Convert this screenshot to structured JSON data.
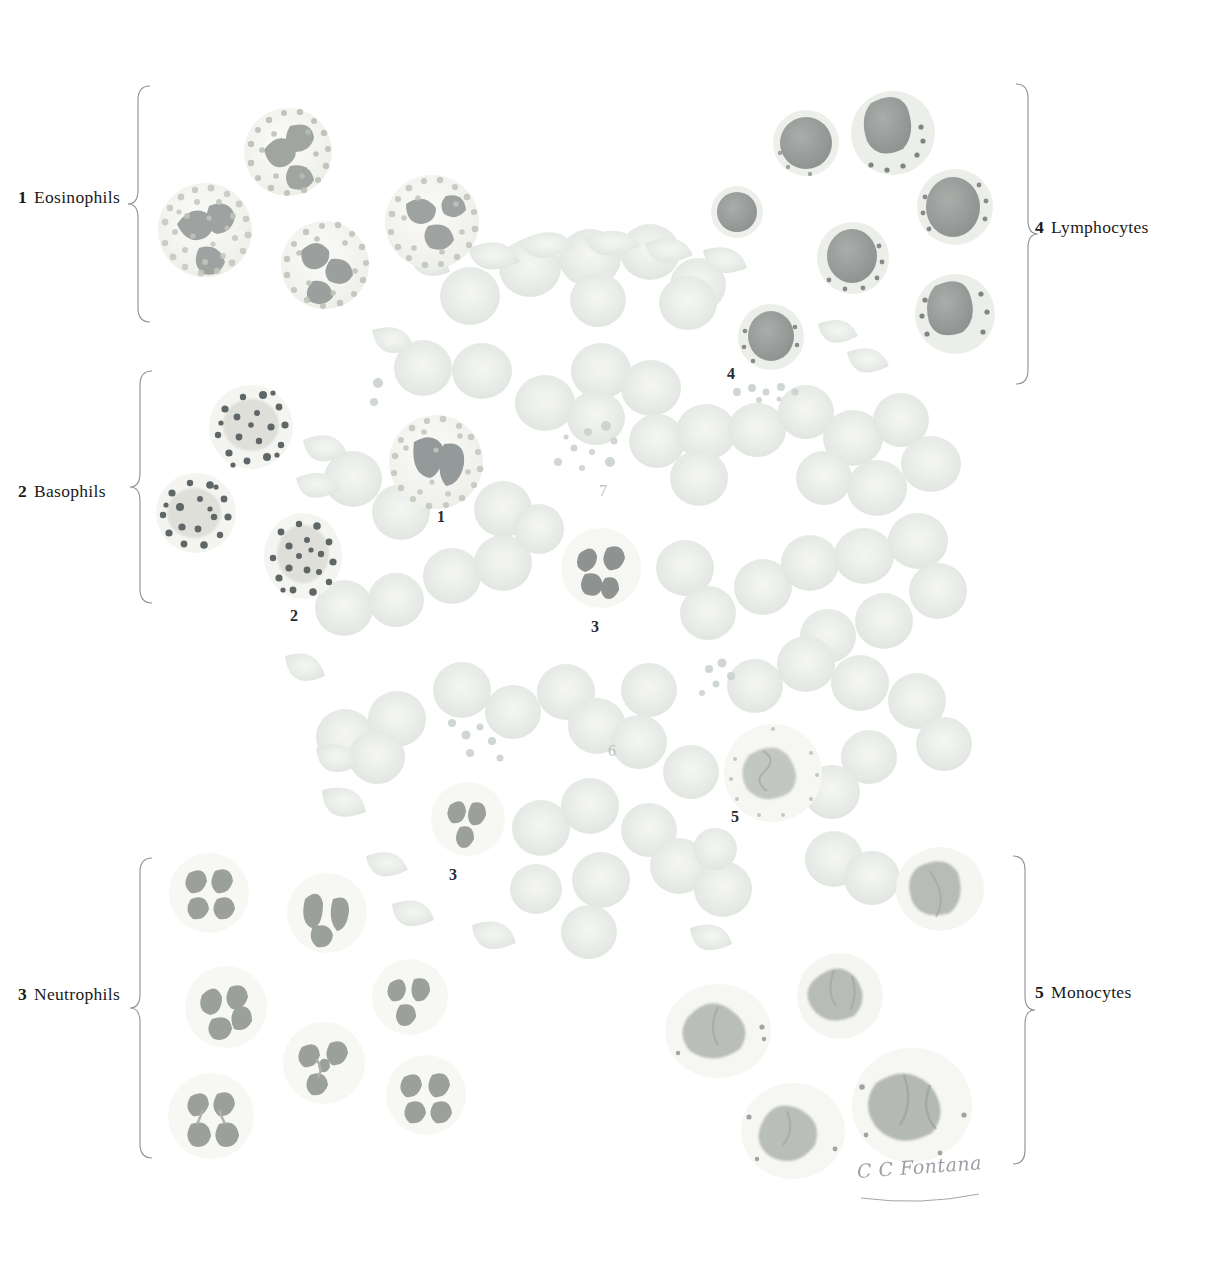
{
  "plate": {
    "title_visible": false,
    "background_color": "#ffffff",
    "ink_color": "#1a1a1a",
    "signature": "C C Fontana"
  },
  "legend": {
    "left_items": [
      {
        "num": "1",
        "label": "Eosinophils",
        "x": 18,
        "y": 187,
        "bracket": {
          "x": 138,
          "y": 86,
          "height": 235
        }
      },
      {
        "num": "2",
        "label": "Basophils",
        "x": 18,
        "y": 481,
        "bracket": {
          "x": 140,
          "y": 371,
          "height": 232
        }
      },
      {
        "num": "3",
        "label": "Neutrophils",
        "x": 18,
        "y": 984,
        "bracket": {
          "x": 140,
          "y": 858,
          "height": 300
        }
      }
    ],
    "right_items": [
      {
        "num": "4",
        "label": "Lymphocytes",
        "x": 1035,
        "y": 217,
        "bracket": {
          "x": 1016,
          "y": 84,
          "height": 300
        }
      },
      {
        "num": "5",
        "label": "Monocytes",
        "x": 1035,
        "y": 982,
        "bracket": {
          "x": 1013,
          "y": 856,
          "height": 310
        }
      }
    ]
  },
  "callouts": [
    {
      "id": "1",
      "text": "1",
      "x": 437,
      "y": 508,
      "faint": false
    },
    {
      "id": "2",
      "text": "2",
      "x": 290,
      "y": 607,
      "faint": false
    },
    {
      "id": "3a",
      "text": "3",
      "x": 591,
      "y": 618,
      "faint": false
    },
    {
      "id": "3b",
      "text": "3",
      "x": 449,
      "y": 866,
      "faint": false
    },
    {
      "id": "4",
      "text": "4",
      "x": 727,
      "y": 365,
      "faint": false
    },
    {
      "id": "5",
      "text": "5",
      "x": 731,
      "y": 808,
      "faint": false
    },
    {
      "id": "6",
      "text": "6",
      "x": 608,
      "y": 742,
      "faint": true
    },
    {
      "id": "7",
      "text": "7",
      "x": 599,
      "y": 482,
      "faint": true
    }
  ],
  "cell_groups": {
    "eosinophils": {
      "key": "1",
      "fill": "#f3f2ee",
      "granule": "#b9bdb4",
      "nucleus": "#9ca0a0",
      "cells": [
        {
          "cx": 205,
          "cy": 230,
          "r": 47,
          "nuclei": 3,
          "seed": 11
        },
        {
          "cx": 288,
          "cy": 152,
          "r": 44,
          "nuclei": 3,
          "seed": 12
        },
        {
          "cx": 325,
          "cy": 265,
          "r": 44,
          "nuclei": 3,
          "seed": 13
        },
        {
          "cx": 432,
          "cy": 222,
          "r": 47,
          "nuclei": 3,
          "seed": 14
        },
        {
          "cx": 436,
          "cy": 462,
          "r": 47,
          "nuclei": 2,
          "seed": 15
        }
      ]
    },
    "basophils": {
      "key": "2",
      "fill": "#f4f3f0",
      "granule": "#5d6466",
      "nucleus": "#c0c4c0",
      "cells": [
        {
          "cx": 251,
          "cy": 427,
          "r": 42,
          "seed": 21
        },
        {
          "cx": 196,
          "cy": 513,
          "r": 40,
          "seed": 22
        },
        {
          "cx": 303,
          "cy": 556,
          "r": 40,
          "seed": 23
        }
      ]
    },
    "neutrophils": {
      "key": "3",
      "fill": "#f6f5f2",
      "granule": "#e0e2dc",
      "nucleus": "#9ba09c",
      "cells": [
        {
          "cx": 209,
          "cy": 893,
          "r": 40,
          "lobes": 4,
          "seed": 31
        },
        {
          "cx": 327,
          "cy": 913,
          "r": 40,
          "lobes": 3,
          "seed": 32
        },
        {
          "cx": 226,
          "cy": 1007,
          "r": 41,
          "lobes": 3,
          "seed": 33
        },
        {
          "cx": 410,
          "cy": 997,
          "r": 38,
          "lobes": 3,
          "seed": 34
        },
        {
          "cx": 324,
          "cy": 1063,
          "r": 41,
          "lobes": 4,
          "seed": 35
        },
        {
          "cx": 211,
          "cy": 1116,
          "r": 43,
          "lobes": 4,
          "seed": 36
        },
        {
          "cx": 426,
          "cy": 1095,
          "r": 40,
          "lobes": 4,
          "seed": 37
        },
        {
          "cx": 468,
          "cy": 819,
          "r": 37,
          "lobes": 3,
          "seed": 38
        },
        {
          "cx": 601,
          "cy": 568,
          "r": 40,
          "lobes": 3,
          "seed": 39
        }
      ]
    },
    "lymphocytes": {
      "key": "4",
      "fill": "#eef0ec",
      "nucleus": "#9a9f9d",
      "rim": "#d7dbd6",
      "cells": [
        {
          "cx": 737,
          "cy": 212,
          "r": 26,
          "seed": 41
        },
        {
          "cx": 806,
          "cy": 143,
          "r": 33,
          "seed": 42
        },
        {
          "cx": 893,
          "cy": 133,
          "r": 42,
          "seed": 43
        },
        {
          "cx": 955,
          "cy": 207,
          "r": 38,
          "seed": 44
        },
        {
          "cx": 853,
          "cy": 258,
          "r": 36,
          "seed": 45
        },
        {
          "cx": 955,
          "cy": 314,
          "r": 40,
          "seed": 46
        },
        {
          "cx": 771,
          "cy": 337,
          "r": 33,
          "seed": 47
        }
      ]
    },
    "monocytes": {
      "key": "5",
      "fill": "#f5f4f1",
      "nucleus": "#b4b9b5",
      "cells": [
        {
          "cx": 940,
          "cy": 889,
          "r": 44,
          "seed": 51
        },
        {
          "cx": 840,
          "cy": 996,
          "r": 43,
          "seed": 52
        },
        {
          "cx": 718,
          "cy": 1031,
          "r": 53,
          "seed": 53
        },
        {
          "cx": 793,
          "cy": 1131,
          "r": 52,
          "seed": 54
        },
        {
          "cx": 912,
          "cy": 1105,
          "r": 60,
          "seed": 55
        },
        {
          "cx": 773,
          "cy": 773,
          "r": 49,
          "seed": 56
        }
      ]
    },
    "erythrocytes": {
      "key": "6",
      "fill": "#eceeea",
      "edge": "#dfe2dd",
      "note": "faint pale green-grey biconcave discs filling the centre of the plate"
    },
    "platelets": {
      "key": "7",
      "fill": "#d8dcd8",
      "note": "small pale clustered thrombocytes near callouts 7 and 4"
    }
  }
}
